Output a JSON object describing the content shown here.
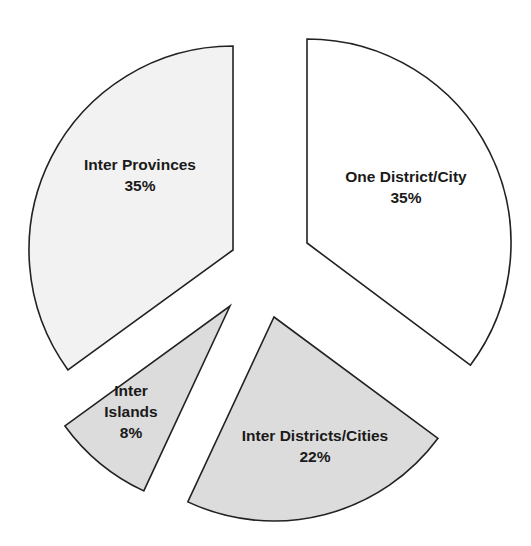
{
  "chart_data": {
    "type": "pie",
    "title": "",
    "exploded": true,
    "categories": [
      "One District/City",
      "Inter Districts/Cities",
      "Inter Islands",
      "Inter Provinces"
    ],
    "values": [
      35,
      22,
      8,
      35
    ],
    "unit": "%",
    "legend": "none (labels inside slices)",
    "slices": [
      {
        "name": "One District/City",
        "value": 35,
        "label_lines": [
          "One District/City",
          "35%"
        ],
        "color": "#ffffff",
        "center": [
          307,
          243
        ],
        "start_deg": -90,
        "end_deg": 36.8,
        "label_pos": [
          406,
          187
        ]
      },
      {
        "name": "Inter Districts/Cities",
        "value": 22,
        "label_lines": [
          "Inter Districts/Cities",
          "22%"
        ],
        "color": "#dcdcdc",
        "center": [
          274,
          317
        ],
        "start_deg": 36.5,
        "end_deg": 115,
        "label_pos": [
          315,
          446
        ]
      },
      {
        "name": "Inter Islands",
        "value": 8,
        "label_lines": [
          "Inter",
          "Islands",
          "8%"
        ],
        "color": "#dcdcdc",
        "center": [
          230,
          306
        ],
        "start_deg": 115,
        "end_deg": 144,
        "label_pos": [
          131,
          412
        ]
      },
      {
        "name": "Inter Provinces",
        "value": 35,
        "label_lines": [
          "Inter Provinces",
          "35%"
        ],
        "color": "#f2f2f2",
        "center": [
          233,
          250
        ],
        "start_deg": 144,
        "end_deg": 270,
        "label_pos": [
          140,
          175
        ]
      }
    ],
    "radius": 204
  }
}
